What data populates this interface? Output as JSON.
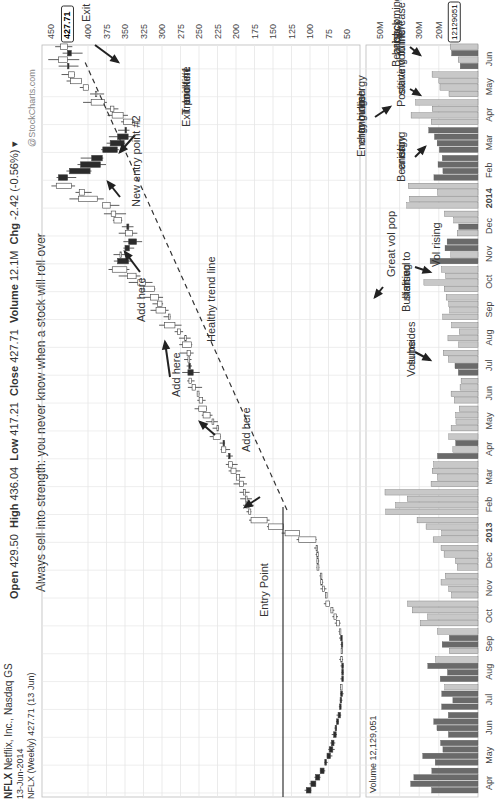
{
  "header": {
    "symbol": "NFLX",
    "company": "Netflix, Inc.",
    "exchange": "Nasdaq GS",
    "date": "13-Jun-2014",
    "series_label": "NFLX (Weekly) 427.71 (13 Jun)",
    "open_label": "Open",
    "open": "429.50",
    "high_label": "High",
    "high": "436.04",
    "low_label": "Low",
    "low": "417.21",
    "close_label": "Close",
    "close": "427.71",
    "volume_label": "Volume",
    "volume": "12.1M",
    "chg_label": "Chg",
    "chg": "-2.42 (-0.56%)",
    "watermark": "@StockCharts.com",
    "price_tag": "427.71",
    "volume_tag": "12129051",
    "volume_legend": "Volume 12,129,051"
  },
  "chart_data": {
    "type": "candlestick",
    "title": "NFLX (Weekly) 427.71 (13 Jun)",
    "price_axis": {
      "ticks": [
        450,
        400,
        375,
        350,
        325,
        300,
        275,
        250,
        225,
        200,
        175,
        150,
        125,
        100,
        75,
        50
      ],
      "range": [
        50,
        450
      ]
    },
    "volume_axis": {
      "ticks": [
        "50M",
        "40M",
        "30M",
        "20M"
      ]
    },
    "x_labels": [
      "Apr",
      "May",
      "Jun",
      "Jul",
      "Aug",
      "Sep",
      "Oct",
      "Nov",
      "Dec",
      "2013",
      "Feb",
      "Mar",
      "Apr",
      "May",
      "Jun",
      "Jul",
      "Aug",
      "Sep",
      "Oct",
      "Nov",
      "Dec",
      "2014",
      "Feb",
      "Mar",
      "Apr",
      "May",
      "Jun"
    ],
    "x_labels_bold": [
      "2013",
      "2014"
    ],
    "price_approx_monthly": [
      105,
      80,
      68,
      60,
      57,
      57,
      60,
      78,
      88,
      92,
      180,
      190,
      210,
      225,
      245,
      265,
      260,
      290,
      310,
      360,
      340,
      370,
      440,
      380,
      340,
      390,
      427.71
    ],
    "volume_approx_monthly_M": [
      28,
      22,
      18,
      17,
      20,
      16,
      30,
      19,
      15,
      25,
      38,
      20,
      16,
      12,
      12,
      14,
      12,
      16,
      22,
      19,
      14,
      28,
      20,
      22,
      28,
      20,
      12.1
    ],
    "annotations": [
      "Always sell into strength: you never know when a stock will roll over",
      "Entry Point",
      "Add here",
      "Add here",
      "Add here",
      "Healthy trend line",
      "New entry point #2",
      "Exit point #1 Trend line broken",
      "Exit point #2",
      "Great vol pop",
      "Volume subsides",
      "Bullish vol starting to rise",
      "Vol rising",
      "Positive volume starting to increase",
      "Bearish energy rising",
      "Energy changing to more bullish energy",
      "Bearish bars coming back"
    ]
  },
  "annotations": {
    "sell_note": "Always sell into strength: you never know when a stock will roll over",
    "entry": "Entry Point",
    "add": "Add here",
    "trend": "Healthy trend line",
    "entry2": "New entry point #2",
    "exit1_a": "Exit point #1",
    "exit1_b": "Trend line",
    "exit1_c": "broken",
    "exit2": "Exit point #2",
    "vol_pop": "Great vol pop",
    "vol_sub_a": "Volume",
    "vol_sub_b": "subsides",
    "bull_a": "Bullish vol",
    "bull_b": "starting to",
    "bull_c": "rise",
    "vol_rising": "Vol rising",
    "pos_a": "Positive volume",
    "pos_b": "starting to increase",
    "bear_a": "Bearish",
    "bear_b": "energy",
    "bear_c": "rising",
    "energy_a": "Energy",
    "energy_b": "changing",
    "energy_c": "to more",
    "energy_d": "bullish",
    "energy_e": "energy",
    "bbars_a": "Bearish",
    "bbars_b": "bars coming",
    "bbars_c": "back"
  },
  "colors": {
    "up": "#ffffff",
    "down": "#2b2b2b",
    "vol_up": "#c8c8c8",
    "vol_down": "#6a6a6a",
    "grid": "#e6e6e6",
    "text": "#333333"
  }
}
